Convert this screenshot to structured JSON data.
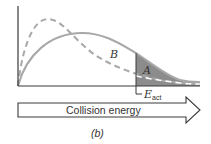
{
  "diagram": {
    "type": "energy-distribution",
    "curves": [
      {
        "name": "lower-temperature",
        "style": "dashed",
        "color": "#a8a8a8"
      },
      {
        "name": "higher-temperature",
        "style": "solid",
        "color": "#a8a8a8"
      }
    ],
    "labels": {
      "region_b": "B",
      "region_a": "A",
      "activation_energy_main": "E",
      "activation_energy_sub": "act",
      "axis_arrow": "Collision energy",
      "panel": "(b)"
    },
    "colors": {
      "axis": "#3a3a3a",
      "curve": "#a8a8a8",
      "shaded_area": "#8c8c8c",
      "arrow_outline": "#3a3a3a"
    }
  }
}
